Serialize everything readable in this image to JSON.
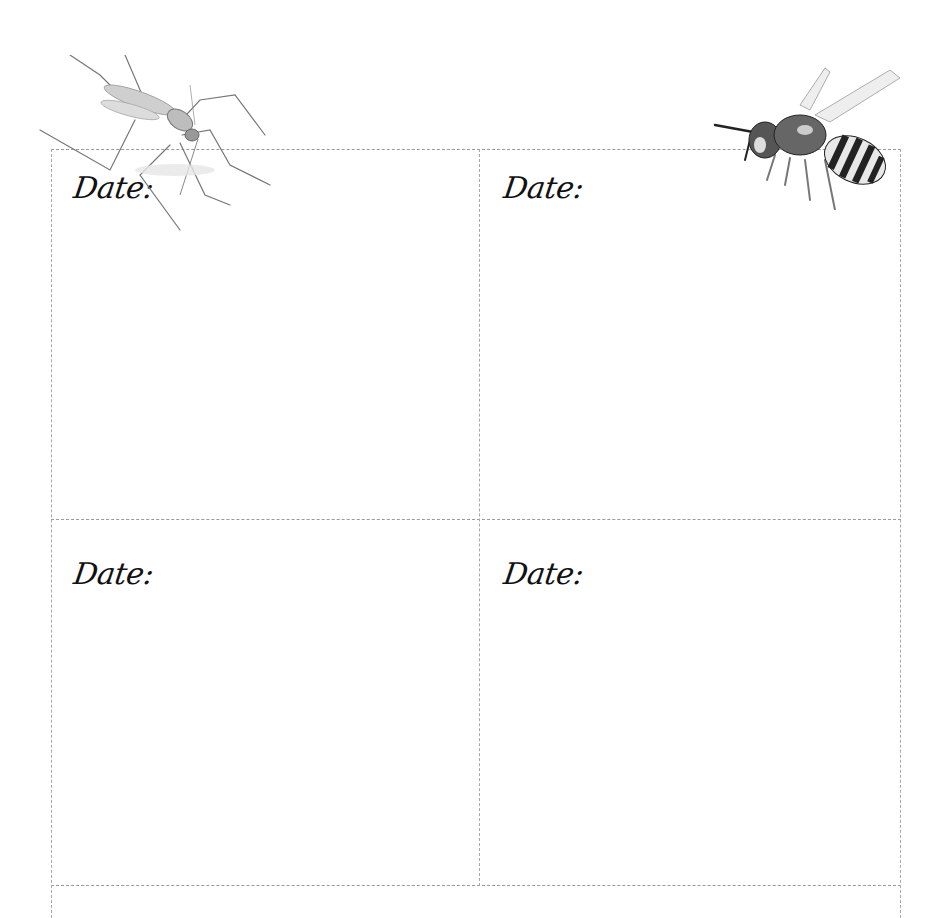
{
  "journal": {
    "cells": [
      {
        "label": "Date:"
      },
      {
        "label": "Date:"
      },
      {
        "label": "Date:"
      },
      {
        "label": "Date:"
      }
    ],
    "illustrations": [
      {
        "name": "mosquito"
      },
      {
        "name": "wasp"
      }
    ]
  }
}
